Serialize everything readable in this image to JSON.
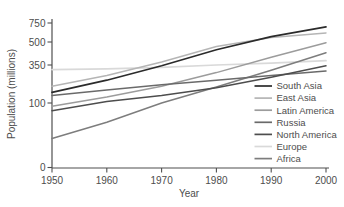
{
  "figure": {
    "background": "#ffffff",
    "axis_color": "#4f4f4f",
    "text_color": "#4d4d4d"
  },
  "chart_data": {
    "type": "line",
    "title": "",
    "xlabel": "Year",
    "ylabel": "Population (millions)",
    "x": [
      1950,
      1960,
      1970,
      1980,
      1990,
      2000
    ],
    "x_tick_labels": [
      "1950",
      "1960",
      "1970",
      "1980",
      "1990",
      "2000"
    ],
    "y_ticks": [
      0,
      100,
      350,
      500,
      750
    ],
    "y_tick_labels": [
      "0",
      "100",
      "350",
      "500",
      "750"
    ],
    "y_axis_note": "tick spacing is non-linear as drawn (0,100,350,500,750 unevenly spaced)",
    "grid": false,
    "legend_position": "right-middle",
    "series": [
      {
        "name": "South Asia",
        "color": "#2b2b2b",
        "values": [
          170,
          250,
          345,
          450,
          570,
          700
        ]
      },
      {
        "name": "East Asia",
        "color": "#b5b5b5",
        "values": [
          210,
          280,
          370,
          470,
          560,
          620
        ]
      },
      {
        "name": "Latin America",
        "color": "#9c9c9c",
        "values": [
          95,
          140,
          210,
          300,
          400,
          495
        ]
      },
      {
        "name": "Russia",
        "color": "#6a6a6a",
        "values": [
          150,
          185,
          220,
          250,
          280,
          310
        ]
      },
      {
        "name": "North America",
        "color": "#4d4d4d",
        "values": [
          88,
          110,
          150,
          200,
          270,
          345
        ]
      },
      {
        "name": "Europe",
        "color": "#d9d9d9",
        "values": [
          320,
          325,
          335,
          350,
          362,
          378
        ]
      },
      {
        "name": "Africa",
        "color": "#7d7d7d",
        "values": [
          45,
          70,
          100,
          205,
          315,
          430
        ]
      }
    ]
  }
}
